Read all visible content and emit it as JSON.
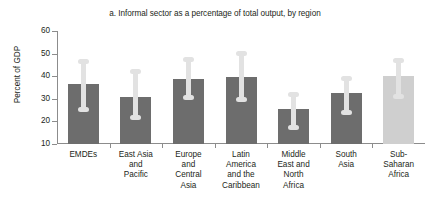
{
  "chart_data": {
    "type": "bar",
    "title": "a. Informal sector as a percentage of total output, by region",
    "xlabel": "",
    "ylabel": "Percent of GDP",
    "ylim": [
      10,
      60
    ],
    "yticks": [
      10,
      20,
      30,
      40,
      50,
      60
    ],
    "ytick_labels": [
      "10",
      "20",
      "30",
      "40",
      "50",
      "60"
    ],
    "grid": false,
    "legend": "none",
    "categories": [
      "EMDEs",
      "East Asia and Pacific",
      "Europe and Central Asia",
      "Latin America and the Caribbean",
      "Middle East and North Africa",
      "South Asia",
      "Sub-Saharan Africa"
    ],
    "category_lines": [
      [
        "EMDEs"
      ],
      [
        "East Asia",
        "and",
        "Pacific"
      ],
      [
        "Europe",
        "and",
        "Central",
        "Asia"
      ],
      [
        "Latin",
        "America",
        "and the",
        "Caribbean"
      ],
      [
        "Middle",
        "East and",
        "North",
        "Africa"
      ],
      [
        "South",
        "Asia"
      ],
      [
        "Sub-",
        "Saharan",
        "Africa"
      ]
    ],
    "values": [
      36.5,
      31.0,
      38.7,
      39.5,
      25.5,
      32.5,
      40.2
    ],
    "error_high": [
      47.5,
      43.0,
      48.5,
      51.0,
      32.8,
      40.0,
      48.0
    ],
    "error_low": [
      24.0,
      20.5,
      29.5,
      28.5,
      16.0,
      23.0,
      30.0
    ],
    "bar_colors": [
      "#6d6d6d",
      "#6d6d6d",
      "#6d6d6d",
      "#6d6d6d",
      "#6d6d6d",
      "#6d6d6d",
      "#cfcfcf"
    ],
    "whisker_color": "#e2e2e2",
    "axis_color": "#8c8c8c",
    "text_color": "#231f20",
    "background": "#ffffff"
  }
}
